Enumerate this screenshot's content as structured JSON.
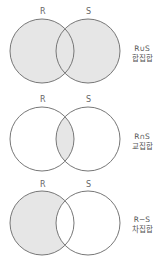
{
  "diagrams": [
    {
      "set_a": "R",
      "set_b": "S",
      "operator": "R∪S",
      "name": "합집합",
      "shaded": "union",
      "fill_color": "#e6e6e6",
      "stroke_color": "#777777"
    },
    {
      "set_a": "R",
      "set_b": "S",
      "operator": "R∩S",
      "name": "교집합",
      "shaded": "intersection",
      "fill_color": "#e6e6e6",
      "stroke_color": "#777777"
    },
    {
      "set_a": "R",
      "set_b": "S",
      "operator": "R−S",
      "name": "차집합",
      "shaded": "difference",
      "fill_color": "#e6e6e6",
      "stroke_color": "#777777"
    }
  ]
}
